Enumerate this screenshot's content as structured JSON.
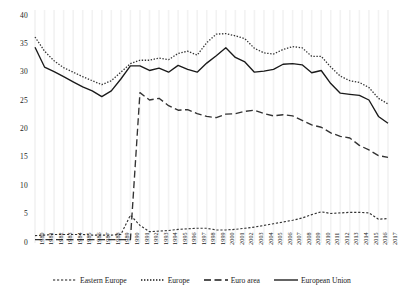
{
  "chart_data": {
    "type": "line",
    "title": "",
    "subtitle": "",
    "xlabel": "",
    "ylabel": "",
    "ylim": [
      0,
      40
    ],
    "yticks": [
      0,
      5,
      10,
      15,
      20,
      25,
      30,
      35,
      40
    ],
    "grid": "faint-vertical",
    "legend_position": "bottom",
    "categories": [
      "1980",
      "1981",
      "1982",
      "1983",
      "1984",
      "1985",
      "1986",
      "1987",
      "1988",
      "1989",
      "1990",
      "1991",
      "1992",
      "1993",
      "1994",
      "1995",
      "1996",
      "1997",
      "1998",
      "1999",
      "2000",
      "2001",
      "2002",
      "2003",
      "2004",
      "2005",
      "2006",
      "2007",
      "2008",
      "2009",
      "2010",
      "2011",
      "2012",
      "2013",
      "2014",
      "2015",
      "2016",
      "2017"
    ],
    "series": [
      {
        "name": "Eastern Europe",
        "style": "fine-dashed",
        "color": "#333333",
        "values": [
          1.3,
          1.4,
          1.5,
          1.5,
          1.5,
          1.5,
          1.4,
          1.4,
          1.4,
          1.5,
          4.9,
          3.1,
          2.0,
          2.1,
          2.2,
          2.4,
          2.5,
          2.6,
          2.6,
          2.3,
          2.3,
          2.4,
          2.6,
          2.8,
          3.1,
          3.4,
          3.7,
          4.0,
          4.4,
          5.0,
          5.5,
          5.2,
          5.3,
          5.4,
          5.4,
          5.3,
          4.2,
          4.3
        ]
      },
      {
        "name": "Europe",
        "style": "dotted",
        "color": "#333333",
        "values": [
          36.3,
          33.8,
          32.1,
          30.9,
          30.1,
          29.3,
          28.6,
          27.9,
          28.6,
          30.1,
          31.6,
          32.2,
          32.2,
          32.6,
          32.3,
          33.4,
          33.8,
          33.1,
          35.3,
          36.8,
          36.9,
          36.5,
          36.0,
          34.3,
          33.5,
          33.3,
          34.1,
          34.6,
          34.4,
          32.9,
          32.9,
          31.0,
          29.4,
          28.6,
          28.3,
          27.4,
          25.5,
          24.5
        ]
      },
      {
        "name": "Euro area",
        "style": "dashed",
        "color": "#333333",
        "values": [
          0.6,
          0.6,
          0.6,
          0.6,
          0.6,
          0.6,
          0.6,
          0.6,
          0.6,
          0.6,
          0.6,
          26.5,
          25.2,
          25.5,
          24.2,
          23.4,
          23.5,
          22.8,
          22.3,
          22.1,
          22.7,
          22.8,
          23.2,
          23.4,
          22.8,
          22.4,
          22.6,
          22.4,
          21.6,
          20.8,
          20.4,
          19.4,
          18.8,
          18.5,
          17.2,
          16.4,
          15.4,
          15.1
        ]
      },
      {
        "name": "European Union",
        "style": "solid",
        "color": "#1a1a1a",
        "values": [
          34.5,
          31.0,
          30.2,
          29.3,
          28.4,
          27.5,
          26.8,
          25.8,
          26.8,
          28.9,
          31.2,
          31.2,
          30.4,
          30.8,
          30.1,
          31.3,
          30.6,
          30.1,
          31.7,
          33.0,
          34.4,
          32.7,
          31.9,
          30.1,
          30.3,
          30.6,
          31.5,
          31.6,
          31.4,
          30.0,
          30.4,
          28.1,
          26.4,
          26.2,
          26.0,
          25.2,
          22.3,
          21.1
        ]
      }
    ]
  },
  "axes": {
    "y_tick_labels": [
      "0",
      "5",
      "10",
      "15",
      "20",
      "25",
      "30",
      "35",
      "40"
    ],
    "x_tick_labels": [
      "1980",
      "1981",
      "1982",
      "1983",
      "1984",
      "1985",
      "1986",
      "1987",
      "1988",
      "1989",
      "1990",
      "1991",
      "1992",
      "1993",
      "1994",
      "1995",
      "1996",
      "1997",
      "1998",
      "1999",
      "2000",
      "2001",
      "2002",
      "2003",
      "2004",
      "2005",
      "2006",
      "2007",
      "2008",
      "2009",
      "2010",
      "2011",
      "2012",
      "2013",
      "2014",
      "2015",
      "2016",
      "2017"
    ]
  },
  "legend": {
    "items": [
      {
        "label": "Eastern Europe",
        "style": "fine-dashed"
      },
      {
        "label": "Europe",
        "style": "dotted"
      },
      {
        "label": "Euro area",
        "style": "dashed"
      },
      {
        "label": "European Union",
        "style": "solid"
      }
    ]
  }
}
